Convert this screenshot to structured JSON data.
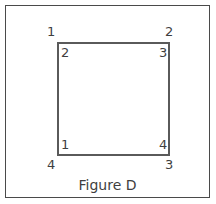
{
  "figure": {
    "caption": "Figure D",
    "shape": "square",
    "colors": {
      "frame_stroke": "#4a4a4a",
      "square_stroke": "#5a5a5a",
      "label_text": "#3f3f3f",
      "background": "#ffffff"
    },
    "outer_corner_labels": {
      "top_left": "1",
      "top_right": "2",
      "bottom_left": "4",
      "bottom_right": "3"
    },
    "inner_corner_labels": {
      "top_left": "2",
      "top_right": "3",
      "bottom_left": "1",
      "bottom_right": "4"
    }
  }
}
